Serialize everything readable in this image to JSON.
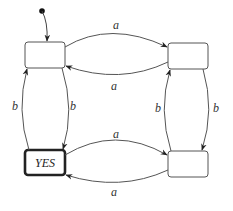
{
  "diagram": {
    "type": "state-machine",
    "initial_state": "s1",
    "states": [
      {
        "id": "s1",
        "label": "",
        "accepting": false
      },
      {
        "id": "s2",
        "label": "",
        "accepting": false
      },
      {
        "id": "s3",
        "label": "YES",
        "accepting": true
      },
      {
        "id": "s4",
        "label": "",
        "accepting": false
      }
    ],
    "transitions": [
      {
        "from": "s1",
        "to": "s2",
        "label": "a"
      },
      {
        "from": "s2",
        "to": "s1",
        "label": "a"
      },
      {
        "from": "s1",
        "to": "s3",
        "label": "b"
      },
      {
        "from": "s3",
        "to": "s1",
        "label": "b"
      },
      {
        "from": "s2",
        "to": "s4",
        "label": "b"
      },
      {
        "from": "s4",
        "to": "s2",
        "label": "b"
      },
      {
        "from": "s3",
        "to": "s4",
        "label": "a"
      },
      {
        "from": "s4",
        "to": "s3",
        "label": "a"
      }
    ],
    "colors": {
      "stroke": "#555555",
      "accepting_stroke": "#222222",
      "background": "#ffffff"
    }
  }
}
